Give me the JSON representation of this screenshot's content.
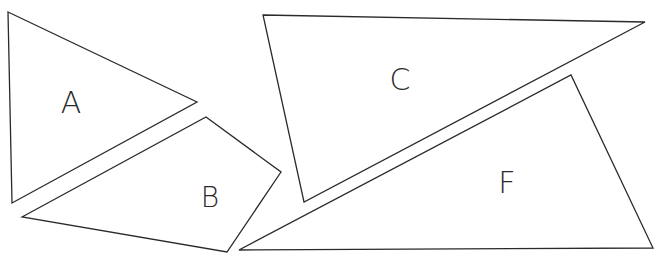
{
  "diagram": {
    "type": "geometric-shapes",
    "stroke_color": "#2a2a2a",
    "background": "#ffffff",
    "shapes": [
      {
        "id": "A",
        "label": "A",
        "kind": "triangle",
        "points": "8,12 197,102 12,203",
        "label_x": 71,
        "label_y": 113,
        "label_size": 30
      },
      {
        "id": "B",
        "label": "B",
        "kind": "quadrilateral",
        "points": "22,217 206,117 281,172 227,252",
        "label_x": 210,
        "label_y": 207,
        "label_size": 28
      },
      {
        "id": "C",
        "label": "C",
        "kind": "triangle",
        "points": "263,15 645,22 304,202",
        "label_x": 400,
        "label_y": 90,
        "label_size": 30
      },
      {
        "id": "F",
        "label": "F",
        "kind": "triangle",
        "points": "239,250 571,75 653,248",
        "label_x": 507,
        "label_y": 193,
        "label_size": 30
      }
    ]
  }
}
